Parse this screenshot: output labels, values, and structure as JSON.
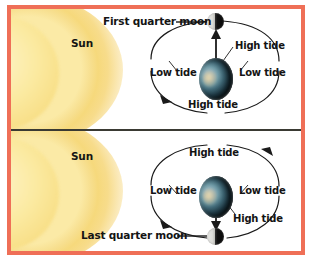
{
  "figure": {
    "border_color": "#ef6f57",
    "divider_color": "#3a3a33",
    "background_color": "#ffffff",
    "sun_color": "#f8e08a",
    "label_color": "#141414"
  },
  "panels": [
    {
      "id": "first-quarter",
      "sun_label": "Sun",
      "moon_label": "First quarter moon",
      "moon_position": "top",
      "moon_phase": "first quarter",
      "earth_label": "",
      "tides": [
        {
          "id": "tide-top-right",
          "label": "High tide",
          "position": "top-right"
        },
        {
          "id": "tide-left",
          "label": "Low tide",
          "position": "left"
        },
        {
          "id": "tide-right",
          "label": "Low tide",
          "position": "right"
        },
        {
          "id": "tide-bottom",
          "label": "High tide",
          "position": "bottom"
        }
      ],
      "orbit_direction": "counterclockwise",
      "tide_bulge_arrow": "up"
    },
    {
      "id": "last-quarter",
      "sun_label": "Sun",
      "moon_label": "Last quarter moon",
      "moon_position": "bottom",
      "moon_phase": "last quarter",
      "earth_label": "",
      "tides": [
        {
          "id": "tide-top",
          "label": "High tide",
          "position": "top"
        },
        {
          "id": "tide-left",
          "label": "Low tide",
          "position": "left"
        },
        {
          "id": "tide-right",
          "label": "Low tide",
          "position": "right"
        },
        {
          "id": "tide-bottom-right",
          "label": "High tide",
          "position": "bottom-right"
        }
      ],
      "orbit_direction": "counterclockwise",
      "tide_bulge_arrow": "down"
    }
  ]
}
